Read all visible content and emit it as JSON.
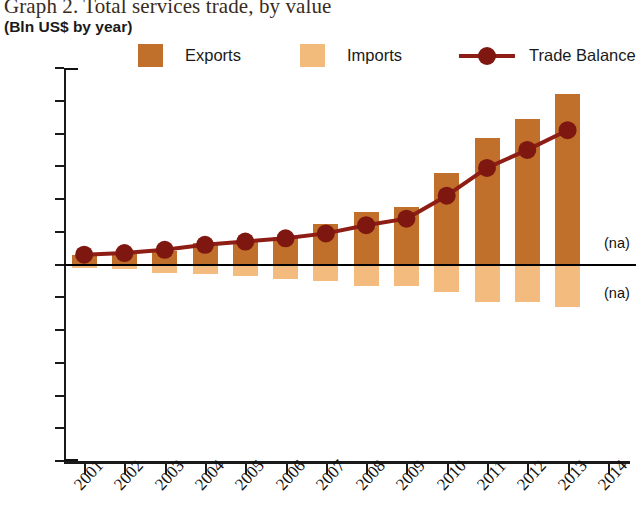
{
  "title": "Graph 2. Total services trade, by value",
  "subtitle": "(Bln US$ by year)",
  "legend": {
    "exports_label": "Exports",
    "imports_label": "Imports",
    "balance_label": "Trade Balance"
  },
  "annotations": {
    "na_exports": "(na)",
    "na_imports": "(na)"
  },
  "colors": {
    "exports": "#C0702B",
    "imports": "#F3BC7E",
    "balance": "#8E1D15",
    "axis": "#111111"
  },
  "chart_data": {
    "type": "bar",
    "title": "Graph 2. Total services trade, by value",
    "subtitle": "(Bln US$ by year)",
    "xlabel": "",
    "ylabel": "Bln US$ by year",
    "ylim": [
      -60,
      60
    ],
    "yticks": [
      60,
      50,
      40,
      30,
      20,
      10,
      0,
      -10,
      -20,
      -30,
      -40,
      -50,
      -60
    ],
    "ytick_labels": [
      "60",
      "50",
      "40",
      "30",
      "20",
      "10",
      "0",
      "−10",
      "−20",
      "−30",
      "−40",
      "−50",
      "−60"
    ],
    "grid": false,
    "legend_position": "top",
    "categories": [
      "2001",
      "2002",
      "2003",
      "2004",
      "2005",
      "2006",
      "2007",
      "2008",
      "2009",
      "2010",
      "2011",
      "2012",
      "2013",
      "2014"
    ],
    "series": [
      {
        "name": "Exports",
        "type": "bar",
        "color": "#C0702B",
        "values": [
          3.0,
          3.5,
          4.0,
          6.5,
          7.0,
          8.5,
          12.5,
          16.0,
          17.5,
          28.0,
          38.5,
          44.5,
          52.0,
          null
        ]
      },
      {
        "name": "Imports",
        "type": "bar",
        "color": "#F3BC7E",
        "note": "plotted below the zero line as negative values",
        "values": [
          -1.0,
          -1.5,
          -2.5,
          -3.0,
          -3.5,
          -4.5,
          -5.0,
          -6.5,
          -6.5,
          -8.5,
          -11.5,
          -11.5,
          -13.0,
          null
        ]
      },
      {
        "name": "Trade Balance",
        "type": "line",
        "color": "#8E1D15",
        "values": [
          3.0,
          3.5,
          4.5,
          6.0,
          7.0,
          8.0,
          9.5,
          12.0,
          14.0,
          21.0,
          29.5,
          35.0,
          41.0,
          null
        ]
      }
    ],
    "missing_data_note": "2014 values not available (na)"
  }
}
